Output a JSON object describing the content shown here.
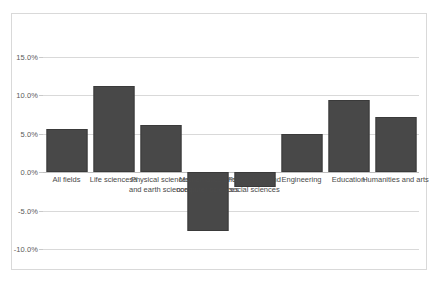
{
  "chart_data": {
    "type": "bar",
    "title": "",
    "subtitle": "",
    "xlabel": "",
    "ylabel": "",
    "ylim": [
      -10.0,
      15.0
    ],
    "ytick_labels": [
      "15.0%",
      "10.0%",
      "5.0%",
      "0.0%",
      "-5.0%",
      "-10.0%"
    ],
    "ytick_values": [
      15.0,
      10.0,
      5.0,
      0.0,
      -5.0,
      -10.0
    ],
    "grid": true,
    "legend": "none",
    "categories": [
      "All fields",
      "Life sciencesa",
      "Physical sciences and earth sciences",
      "Mathematics and computer sciences",
      "Psychology and social sciences",
      "Engineering",
      "Education",
      "Humanities and arts"
    ],
    "values": [
      5.6,
      11.2,
      6.1,
      -7.7,
      -1.9,
      5.0,
      9.4,
      7.2
    ],
    "bar_color": "#484848",
    "gridline_color": "#d9d9d9",
    "border_color": "#d9d9d9"
  }
}
